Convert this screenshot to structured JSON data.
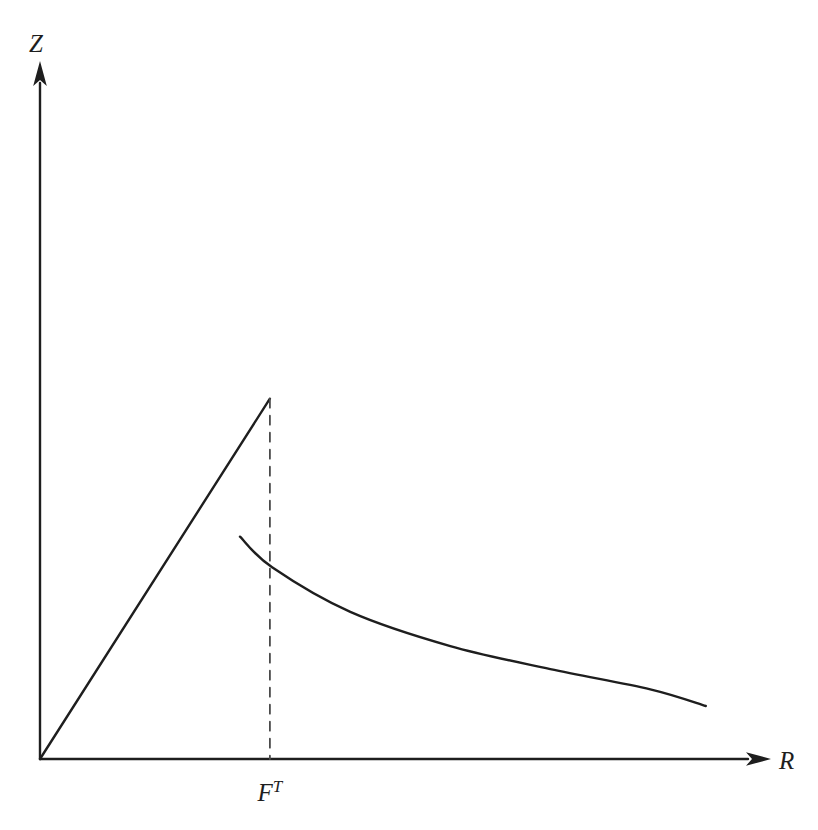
{
  "figure": {
    "background": "#ffffff",
    "line_color": "#1e1e1e",
    "dashed_color": "#4a4a4a"
  },
  "labels": {
    "y_axis": "Z",
    "x_axis": "R",
    "threshold_base": "F",
    "threshold_sup": "T"
  },
  "chart_data": {
    "type": "line",
    "title": "",
    "xlabel": "R",
    "ylabel": "Z",
    "xlim": [
      0,
      10
    ],
    "ylim": [
      0,
      10
    ],
    "grid": false,
    "legend": false,
    "annotations": [
      {
        "text": "F^T",
        "x": 3.15,
        "y": 0,
        "position": "below-x-axis"
      }
    ],
    "series": [
      {
        "name": "rising-line",
        "style": "solid",
        "points": [
          [
            0,
            0
          ],
          [
            3.15,
            5.17
          ]
        ]
      },
      {
        "name": "declining-curve",
        "style": "solid",
        "points": [
          [
            2.74,
            3.19
          ],
          [
            3.18,
            2.75
          ],
          [
            4.25,
            2.11
          ],
          [
            5.62,
            1.62
          ],
          [
            6.99,
            1.29
          ],
          [
            8.36,
            1.0
          ],
          [
            9.12,
            0.76
          ]
        ]
      },
      {
        "name": "threshold-dashed-line",
        "style": "dashed",
        "points": [
          [
            3.15,
            5.17
          ],
          [
            3.15,
            0
          ]
        ]
      }
    ]
  }
}
